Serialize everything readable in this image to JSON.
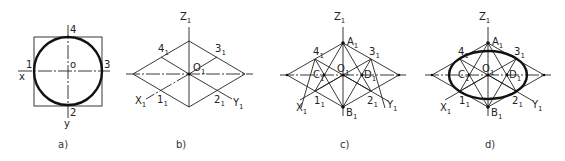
{
  "figure": {
    "panels": [
      {
        "id": "a",
        "caption": "a)",
        "labels": {
          "p1": "1",
          "p2": "2",
          "p3": "3",
          "p4": "4",
          "origin": "o",
          "x": "x",
          "y": "y"
        }
      },
      {
        "id": "b",
        "caption": "b)",
        "labels": {
          "z": "Z",
          "x": "X",
          "y": "Y",
          "o": "O",
          "p1": "1",
          "p2": "2",
          "p3": "3",
          "p4": "4",
          "sub": "1"
        }
      },
      {
        "id": "c",
        "caption": "c)",
        "labels": {
          "z": "Z",
          "x": "X",
          "y": "Y",
          "o": "O",
          "a": "A",
          "b": "B",
          "c": "C",
          "d": "D",
          "p1": "1",
          "p2": "2",
          "p3": "3",
          "p4": "4",
          "sub": "1"
        }
      },
      {
        "id": "d",
        "caption": "d)",
        "labels": {
          "z": "Z",
          "x": "X",
          "y": "Y",
          "o": "O",
          "a": "A",
          "b": "B",
          "c": "C",
          "d": "D",
          "p1": "1",
          "p2": "2",
          "p3": "3",
          "p4": "4",
          "sub": "1"
        }
      }
    ]
  }
}
